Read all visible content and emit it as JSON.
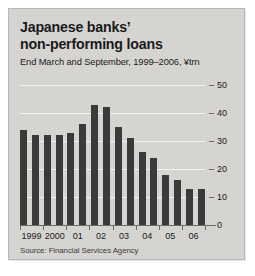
{
  "figure": {
    "title_line1": "Japanese banks’",
    "title_line2": "non-performing loans",
    "subtitle": "End March and September, 1999–2006, ¥trn",
    "source": "Source: Financial Services Agency",
    "panel_color": "#d6d4d1",
    "bar_color": "#3a3a3a",
    "gridline_color": "#f4f3f1"
  },
  "chart_data": {
    "type": "bar",
    "title": "Japanese banks’ non-performing loans",
    "subtitle": "End March and September, 1999–2006, ¥trn",
    "xlabel": "",
    "ylabel": "¥trn",
    "ylim": [
      0,
      50
    ],
    "yticks": [
      0,
      10,
      20,
      30,
      40,
      50
    ],
    "grid": true,
    "legend": "none",
    "source": "Source: Financial Services Agency",
    "categories": [
      "Mar 1999",
      "Sep 1999",
      "Mar 2000",
      "Sep 2000",
      "Mar 2001",
      "Sep 2001",
      "Mar 2002",
      "Sep 2002",
      "Mar 2003",
      "Sep 2003",
      "Mar 2004",
      "Sep 2004",
      "Mar 2005",
      "Sep 2005",
      "Mar 2006",
      "Sep 2006"
    ],
    "values": [
      34,
      32,
      32,
      32,
      33,
      36,
      43,
      42,
      35,
      31,
      26,
      24,
      18,
      16,
      13,
      13
    ],
    "axis_labels": [
      "1999",
      "2000",
      "01",
      "02",
      "03",
      "04",
      "05",
      "06"
    ]
  }
}
